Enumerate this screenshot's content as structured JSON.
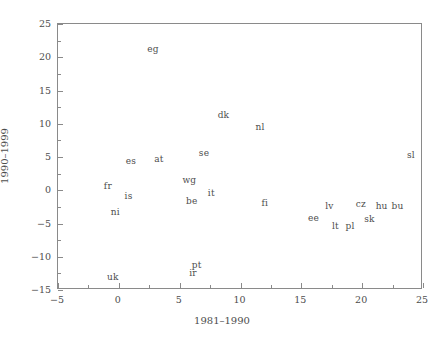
{
  "chart_data": {
    "type": "scatter",
    "title": "",
    "xlabel": "1981–1990",
    "ylabel": "1990–1999",
    "xlim": [
      -5,
      25
    ],
    "ylim": [
      -15,
      25
    ],
    "grid": false,
    "legend": null,
    "marker_style": "text-label",
    "xticks": [
      -5,
      0,
      5,
      10,
      15,
      20,
      25
    ],
    "xtick_labels": [
      "−5",
      "0",
      "5",
      "10",
      "15",
      "20",
      "25"
    ],
    "xticks_minor": [
      -2.5,
      2.5,
      7.5,
      12.5,
      17.5,
      22.5
    ],
    "yticks": [
      -15,
      -10,
      -5,
      0,
      5,
      10,
      15,
      20,
      25
    ],
    "ytick_labels": [
      "−15",
      "−10",
      "−5",
      "0",
      "5",
      "10",
      "15",
      "20",
      "25"
    ],
    "yticks_minor": [
      -12.5,
      -7.5,
      -2.5,
      2.5,
      7.5,
      12.5,
      17.5,
      22.5
    ],
    "points": [
      {
        "label": "eg",
        "x": 2.8,
        "y": 21.3
      },
      {
        "label": "dk",
        "x": 8.6,
        "y": 11.3
      },
      {
        "label": "nl",
        "x": 11.6,
        "y": 9.5
      },
      {
        "label": "se",
        "x": 7.0,
        "y": 5.6
      },
      {
        "label": "at",
        "x": 3.3,
        "y": 4.7
      },
      {
        "label": "es",
        "x": 1.0,
        "y": 4.4
      },
      {
        "label": "sl",
        "x": 24.0,
        "y": 5.3
      },
      {
        "label": "wg",
        "x": 5.8,
        "y": 1.6
      },
      {
        "label": "fr",
        "x": -0.9,
        "y": 0.6
      },
      {
        "label": "is",
        "x": 0.8,
        "y": -0.8
      },
      {
        "label": "it",
        "x": 7.6,
        "y": -0.4
      },
      {
        "label": "be",
        "x": 6.0,
        "y": -1.6
      },
      {
        "label": "fi",
        "x": 12.0,
        "y": -1.9
      },
      {
        "label": "lv",
        "x": 17.3,
        "y": -2.3
      },
      {
        "label": "cz",
        "x": 19.9,
        "y": -2.0
      },
      {
        "label": "hu",
        "x": 21.6,
        "y": -2.3
      },
      {
        "label": "bu",
        "x": 22.9,
        "y": -2.3
      },
      {
        "label": "ni",
        "x": -0.3,
        "y": -3.2
      },
      {
        "label": "ee",
        "x": 16.0,
        "y": -4.2
      },
      {
        "label": "sk",
        "x": 20.6,
        "y": -4.3
      },
      {
        "label": "lt",
        "x": 17.8,
        "y": -5.4
      },
      {
        "label": "pl",
        "x": 19.0,
        "y": -5.4
      },
      {
        "label": "pt",
        "x": 6.4,
        "y": -11.3
      },
      {
        "label": "ir",
        "x": 6.1,
        "y": -12.4
      },
      {
        "label": "uk",
        "x": -0.5,
        "y": -13.0
      }
    ]
  },
  "style": {
    "axis_color": "#8a8a8a",
    "text_color": "#4d4d4d",
    "background": "#ffffff"
  }
}
